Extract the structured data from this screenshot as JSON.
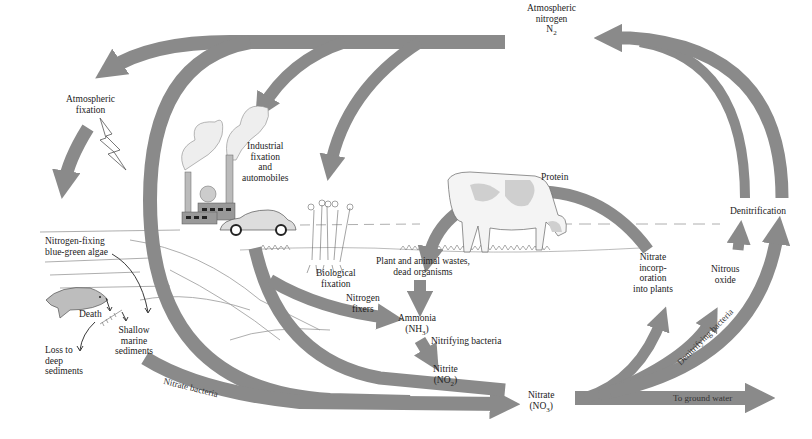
{
  "diagram": {
    "colors": {
      "arrow": "#8a8a8a",
      "background": "#ffffff",
      "text": "#222222",
      "line_art": "#555555"
    },
    "nodes": {
      "atmospheric_nitrogen": {
        "line1": "Atmospheric",
        "line2": "nitrogen",
        "formula_main": "N",
        "formula_sub": "2"
      },
      "atmospheric_fixation": {
        "line1": "Atmospheric",
        "line2": "fixation"
      },
      "industrial_fixation": {
        "line1": "Industrial",
        "line2": "fixation",
        "line3": "and",
        "line4": "automobiles"
      },
      "biological_fixation": {
        "line1": "Biological",
        "line2": "fixation"
      },
      "nitrogen_fixers": {
        "line1": "Nitrogen",
        "line2": "fixers"
      },
      "protein": {
        "label": "Protein"
      },
      "plant_animal_wastes": {
        "line1": "Plant and animal wastes,",
        "line2": "dead organisms"
      },
      "ammonia": {
        "name": "Ammonia",
        "formula_pre": "(NH",
        "formula_sub": "3",
        "formula_post": ")"
      },
      "nitrifying_bacteria": {
        "label": "Nitrifying bacteria"
      },
      "nitrite": {
        "name": "Nitrite",
        "formula_pre": "(NO",
        "formula_sub": "2",
        "formula_post": ")"
      },
      "nitrate": {
        "name": "Nitrate",
        "formula_pre": "(NO",
        "formula_sub": "3",
        "formula_post": ")"
      },
      "nitrate_incorporation": {
        "line1": "Nitrate",
        "line2": "incorp-",
        "line3": "oration",
        "line4": "into plants"
      },
      "nitrous_oxide": {
        "line1": "Nitrous",
        "line2": "oxide"
      },
      "denitrification": {
        "label": "Denitrification"
      },
      "denitrifying_bacteria": {
        "label": "Denitrifying bacteria"
      },
      "to_ground_water": {
        "label": "To ground water"
      },
      "nitrate_bacteria": {
        "label": "Nitrate bacteria"
      },
      "blue_green_algae": {
        "line1": "Nitrogen-fixing",
        "line2": "blue-green algae"
      },
      "death": {
        "label": "Death"
      },
      "shallow_sediments": {
        "line1": "Shallow",
        "line2": "marine",
        "line3": "sediments"
      },
      "deep_sediments": {
        "line1": "Loss to",
        "line2": "deep",
        "line3": "sediments"
      }
    },
    "illustrations": [
      "factory",
      "car",
      "lightning",
      "cow",
      "plants",
      "fish",
      "clouds",
      "landscape"
    ]
  }
}
